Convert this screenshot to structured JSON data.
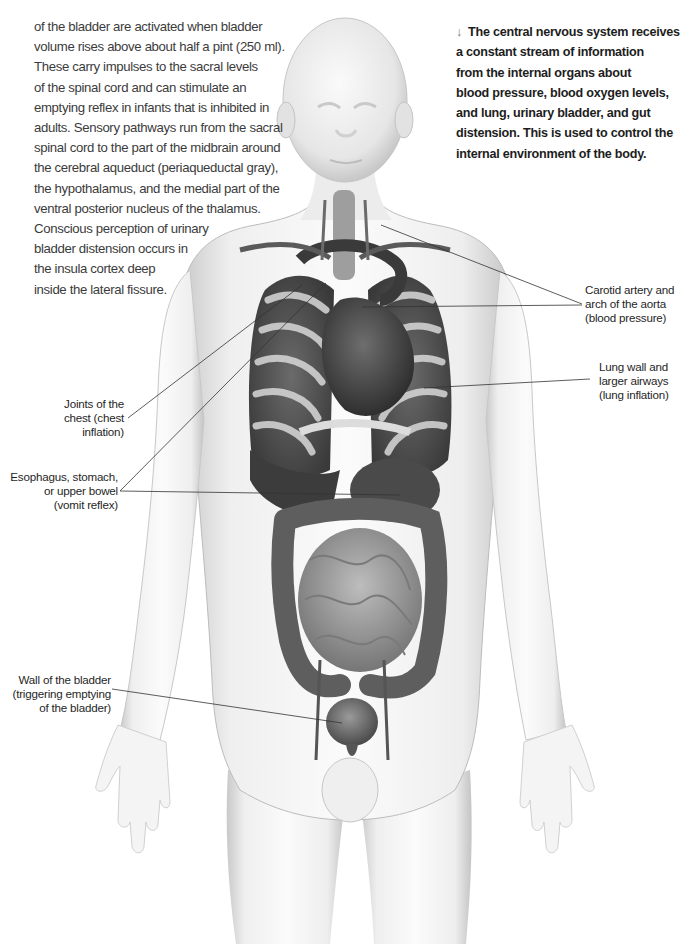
{
  "intro_text": {
    "lines": [
      "of the bladder are activated when bladder",
      "volume rises above about half a pint (250 ml).",
      "These carry impulses to the sacral levels",
      "of the spinal cord and can stimulate an",
      "emptying reflex in infants that is inhibited in",
      "adults. Sensory pathways run from the sacral",
      "spinal cord to the part of the midbrain around",
      "the cerebral aqueduct (periaqueductal gray),",
      "the hypothalamus, and the medial part of the",
      "ventral posterior nucleus of the thalamus.",
      "Conscious perception of urinary",
      "bladder distension occurs in",
      "the insula cortex deep",
      "inside the lateral fissure."
    ]
  },
  "caption": {
    "arrow_icon": "↓",
    "lines": [
      "The central nervous system receives",
      "a constant stream of information",
      "from the internal organs about",
      "blood pressure, blood oxygen levels,",
      "and lung, urinary bladder, and gut",
      "distension. This is used to control the",
      "internal environment of the body."
    ]
  },
  "labels": {
    "carotid": {
      "lines": [
        "Carotid artery and",
        "arch of the aorta",
        "(blood pressure)"
      ]
    },
    "lung": {
      "lines": [
        "Lung wall and",
        "larger airways",
        "(lung inflation)"
      ]
    },
    "chest_joints": {
      "lines": [
        "Joints of the",
        "chest (chest",
        "inflation)"
      ]
    },
    "esophagus": {
      "lines": [
        "Esophagus, stomach,",
        "or upper bowel",
        "(vomit reflex)"
      ]
    },
    "bladder": {
      "lines": [
        "Wall of the bladder",
        "(triggering emptying",
        "of the bladder)"
      ]
    }
  },
  "colors": {
    "background": "#ffffff",
    "body_text": "#3b3b3b",
    "caption_text": "#1d1d1d",
    "leader_line": "#333333",
    "arrow": "#7a7a7a"
  }
}
